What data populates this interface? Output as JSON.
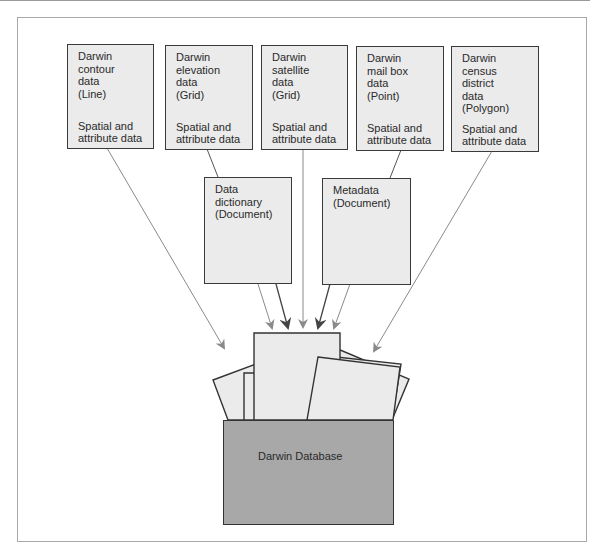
{
  "diagram": {
    "source_boxes": [
      {
        "id": "contour",
        "title": "Darwin\ncontour\ndata\n(Line)",
        "subtitle": "Spatial and\nattribute data"
      },
      {
        "id": "elevation",
        "title": "Darwin\nelevation\ndata\n(Grid)",
        "subtitle": "Spatial and\nattribute data"
      },
      {
        "id": "satellite",
        "title": "Darwin\nsatellite\ndata\n(Grid)",
        "subtitle": "Spatial and\nattribute data"
      },
      {
        "id": "mailbox",
        "title": "Darwin\nmail box\ndata\n(Point)",
        "subtitle": "Spatial and\nattribute data"
      },
      {
        "id": "census",
        "title": "Darwin\ncensus\ndistrict\ndata\n(Polygon)",
        "subtitle": "Spatial and\nattribute data"
      }
    ],
    "document_boxes": [
      {
        "id": "data-dictionary",
        "title": "Data\ndictionary\n(Document)"
      },
      {
        "id": "metadata",
        "title": "Metadata\n(Document)"
      }
    ],
    "database": {
      "label": "Darwin Database"
    },
    "colors": {
      "box_fill": "#ebebeb",
      "box_border": "#3a3a3a",
      "database_fill": "#a8a8a8",
      "arrow_light": "#8a8a8a",
      "arrow_dark": "#444444",
      "frame": "#a9a9a9"
    },
    "edges": [
      {
        "from": "contour",
        "to": "database"
      },
      {
        "from": "elevation",
        "to": "data-dictionary"
      },
      {
        "from": "satellite",
        "to": "database"
      },
      {
        "from": "mailbox",
        "to": "metadata"
      },
      {
        "from": "census",
        "to": "database"
      },
      {
        "from": "data-dictionary",
        "to": "database"
      },
      {
        "from": "metadata",
        "to": "database"
      }
    ]
  }
}
